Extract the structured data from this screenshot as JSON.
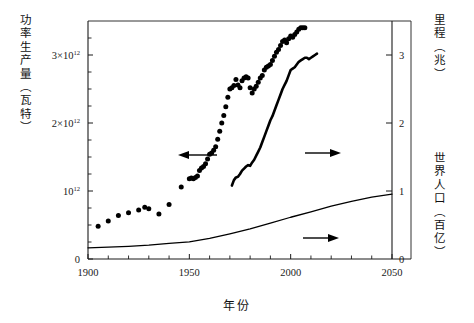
{
  "chart_data": {
    "type": "scatter",
    "title": "",
    "xlabel": "年份",
    "ylabel_left": "功率生产量（瓦特）",
    "ylabel_right_top": "里程（兆）",
    "ylabel_right_bottom": "世界人口（百亿）",
    "xlim": [
      1900,
      2050
    ],
    "xticks": [
      1900,
      1950,
      2000,
      2050
    ],
    "xticklabels": [
      "1900",
      "1950",
      "2000",
      "2050"
    ],
    "xminor_step": 10,
    "left_axis": {
      "lim": [
        0,
        3500000000000
      ],
      "ticks": [
        0,
        1000000000000,
        2000000000000,
        3000000000000
      ],
      "ticklabels": [
        "0",
        "10¹²",
        "2×10¹²",
        "3×10¹²"
      ],
      "ticklabel_parts": [
        {
          "base": "0",
          "mult": "",
          "exp": ""
        },
        {
          "base": "10",
          "mult": "",
          "exp": "12"
        },
        {
          "base": "10",
          "mult": "2×",
          "exp": "12"
        },
        {
          "base": "10",
          "mult": "3×",
          "exp": "12"
        }
      ],
      "minor_step": 250000000000
    },
    "right_axis": {
      "lim": [
        0,
        3.5
      ],
      "ticks": [
        0,
        1,
        2,
        3
      ],
      "ticklabels": [
        "0",
        "1",
        "2",
        "3"
      ]
    },
    "grid": false,
    "legend_position": "inline-arrows",
    "annotations": [
      {
        "name": "arrow-to-left-axis",
        "symbol": "←",
        "points_to": "left-axis",
        "series": "power-production"
      },
      {
        "name": "arrow-to-right-axis-mileage",
        "symbol": "→",
        "points_to": "right-axis",
        "series": "mileage"
      },
      {
        "name": "arrow-to-right-axis-population",
        "symbol": "→",
        "points_to": "right-axis",
        "series": "world-population"
      }
    ],
    "series": [
      {
        "name": "功率生产量",
        "axis": "left",
        "style": "scatter",
        "unit": "瓦特",
        "x": [
          1905,
          1910,
          1915,
          1920,
          1925,
          1928,
          1930,
          1935,
          1940,
          1946,
          1950,
          1951,
          1952,
          1953,
          1954,
          1955,
          1956,
          1957,
          1958,
          1959,
          1960,
          1961,
          1962,
          1963,
          1964,
          1965,
          1966,
          1967,
          1968,
          1969,
          1970,
          1971,
          1972,
          1973,
          1974,
          1975,
          1976,
          1977,
          1978,
          1979,
          1980,
          1981,
          1982,
          1983,
          1984,
          1985,
          1986,
          1987,
          1988,
          1989,
          1990,
          1991,
          1992,
          1993,
          1994,
          1995,
          1996,
          1997,
          1998,
          1999,
          2000,
          2001,
          2002,
          2003,
          2004,
          2005,
          2006,
          2007
        ],
        "y": [
          480000000000,
          560000000000,
          640000000000,
          680000000000,
          720000000000,
          760000000000,
          740000000000,
          660000000000,
          800000000000,
          1060000000000,
          1180000000000,
          1190000000000,
          1180000000000,
          1200000000000,
          1220000000000,
          1300000000000,
          1340000000000,
          1360000000000,
          1400000000000,
          1470000000000,
          1540000000000,
          1560000000000,
          1600000000000,
          1650000000000,
          1760000000000,
          1880000000000,
          2000000000000,
          2110000000000,
          2240000000000,
          2380000000000,
          2500000000000,
          2520000000000,
          2550000000000,
          2640000000000,
          2560000000000,
          2520000000000,
          2620000000000,
          2660000000000,
          2680000000000,
          2660000000000,
          2520000000000,
          2440000000000,
          2500000000000,
          2540000000000,
          2600000000000,
          2660000000000,
          2700000000000,
          2780000000000,
          2820000000000,
          2840000000000,
          2860000000000,
          2920000000000,
          2980000000000,
          3040000000000,
          3080000000000,
          3140000000000,
          3200000000000,
          3220000000000,
          3180000000000,
          3240000000000,
          3280000000000,
          3260000000000,
          3300000000000,
          3340000000000,
          3380000000000,
          3400000000000,
          3400000000000,
          3400000000000
        ]
      },
      {
        "name": "里程",
        "axis": "right",
        "style": "line",
        "unit": "兆",
        "x": [
          1971,
          1972,
          1973,
          1974,
          1975,
          1976,
          1977,
          1978,
          1979,
          1980,
          1981,
          1982,
          1983,
          1984,
          1985,
          1986,
          1987,
          1988,
          1989,
          1990,
          1991,
          1992,
          1993,
          1994,
          1995,
          1996,
          1997,
          1998,
          1999,
          2000,
          2001,
          2002,
          2003,
          2004,
          2005,
          2006,
          2007,
          2008,
          2009,
          2010,
          2011,
          2012,
          2013
        ],
        "y": [
          1.08,
          1.16,
          1.2,
          1.21,
          1.25,
          1.3,
          1.33,
          1.36,
          1.38,
          1.37,
          1.42,
          1.46,
          1.52,
          1.58,
          1.64,
          1.72,
          1.8,
          1.88,
          1.96,
          2.04,
          2.1,
          2.18,
          2.26,
          2.34,
          2.42,
          2.5,
          2.56,
          2.62,
          2.7,
          2.78,
          2.8,
          2.82,
          2.86,
          2.9,
          2.92,
          2.94,
          2.96,
          2.96,
          2.94,
          2.96,
          2.98,
          3.0,
          3.02
        ]
      },
      {
        "name": "世界人口",
        "axis": "right",
        "style": "line",
        "unit": "百亿",
        "x": [
          1900,
          1910,
          1920,
          1930,
          1940,
          1950,
          1960,
          1970,
          1980,
          1990,
          2000,
          2010,
          2020,
          2030,
          2040,
          2050
        ],
        "y": [
          0.165,
          0.175,
          0.186,
          0.203,
          0.229,
          0.253,
          0.303,
          0.37,
          0.444,
          0.527,
          0.614,
          0.693,
          0.776,
          0.849,
          0.909,
          0.955
        ]
      }
    ]
  }
}
